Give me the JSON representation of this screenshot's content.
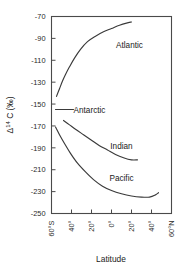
{
  "chart_data": {
    "type": "line",
    "title": "",
    "xlabel": "Latitude",
    "ylabel": "Δ 14C (‰)",
    "ylabel_parts": {
      "delta": "Δ",
      "superscript": "14",
      "element": "C (‰)"
    },
    "xlim": [
      -60,
      60
    ],
    "ylim": [
      -250,
      -70
    ],
    "grid": false,
    "legend_position": "inline-annotations",
    "xticks": [
      -60,
      -40,
      -20,
      0,
      20,
      40,
      60
    ],
    "xtick_labels": [
      "60°S",
      "40°",
      "20°",
      "0°",
      "20°",
      "40°",
      "60°N"
    ],
    "yticks": [
      -70,
      -90,
      -110,
      -130,
      -150,
      -170,
      -190,
      -210,
      -230,
      -250
    ],
    "ytick_labels": [
      "-70",
      "-90",
      "-110",
      "-130",
      "-150",
      "-170",
      "-190",
      "-210",
      "-230",
      "-250"
    ],
    "series": [
      {
        "name": "Atlantic",
        "label_x": 18,
        "label_y": -96,
        "x": [
          -55,
          -52,
          -49,
          -46,
          -42,
          -37,
          -31,
          -24,
          -16,
          -8,
          0,
          8,
          15,
          20
        ],
        "y": [
          -143,
          -136,
          -129,
          -123,
          -116,
          -108,
          -100,
          -93,
          -88,
          -84,
          -81,
          -78,
          -76,
          -75
        ]
      },
      {
        "name": "Antarctic",
        "label_x": -22,
        "label_y": -155,
        "x": [
          -56,
          -50,
          -44,
          -38
        ],
        "y": [
          -155,
          -155,
          -155,
          -155
        ]
      },
      {
        "name": "Indian",
        "label_x": 10,
        "label_y": -188,
        "x": [
          -48,
          -42,
          -36,
          -28,
          -20,
          -12,
          -4,
          4,
          12,
          20,
          26
        ],
        "y": [
          -165,
          -169,
          -173,
          -178,
          -183,
          -188,
          -192,
          -196,
          -199,
          -201,
          -201
        ]
      },
      {
        "name": "Pacific",
        "label_x": 10,
        "label_y": -218,
        "x": [
          -56,
          -52,
          -47,
          -41,
          -34,
          -26,
          -18,
          -9,
          0,
          10,
          20,
          30,
          38,
          44,
          47
        ],
        "y": [
          -171,
          -178,
          -186,
          -195,
          -204,
          -212,
          -219,
          -225,
          -229,
          -232,
          -234,
          -235,
          -235,
          -233,
          -231
        ]
      }
    ]
  }
}
